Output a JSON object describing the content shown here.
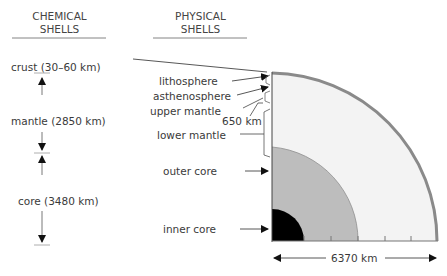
{
  "headers": {
    "chemical": [
      "CHEMICAL",
      "SHELLS"
    ],
    "physical": [
      "PHYSICAL",
      "SHELLS"
    ]
  },
  "chemical_shells": [
    {
      "label": "crust (30–60 km)"
    },
    {
      "label": "mantle (2850 km)"
    },
    {
      "label": "core (3480 km)"
    }
  ],
  "physical_shells": [
    {
      "label": "lithosphere"
    },
    {
      "label": "asthenosphere"
    },
    {
      "label": "upper mantle"
    },
    {
      "label": "650 km"
    },
    {
      "label": "lower mantle"
    },
    {
      "label": "outer core"
    },
    {
      "label": "inner core"
    }
  ],
  "scale": {
    "label": "6370 km"
  },
  "colors": {
    "crust": "#8a8a8a",
    "mantle": "#f3f3f3",
    "outer_core": "#bdbdbd",
    "inner_core": "#000000",
    "lines": "#555555"
  }
}
